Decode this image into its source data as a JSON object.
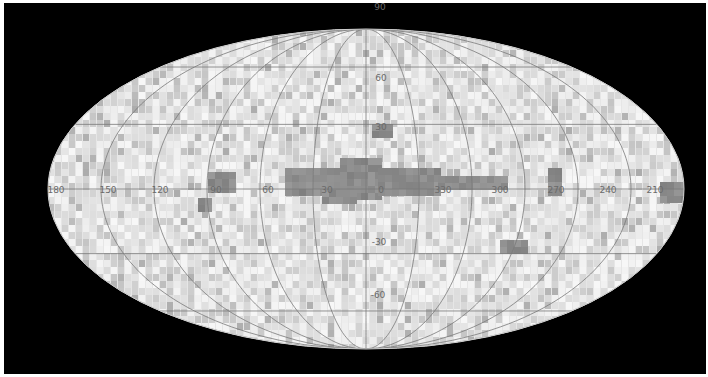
{
  "figure": {
    "type": "all-sky map",
    "projection": "elliptical (Mollweide-like)",
    "background_color": "#000000",
    "map_fill_color": "#e6e6e6",
    "grid_color": "#7a7a7a",
    "dark_cell_color": "#8a8a8a",
    "center": {
      "x": 366,
      "y": 189
    },
    "semi_axes": {
      "rx": 318,
      "ry": 160
    }
  },
  "longitude_labels": [
    {
      "text": "180",
      "x": 56
    },
    {
      "text": "150",
      "x": 108
    },
    {
      "text": "120",
      "x": 160
    },
    {
      "text": "90",
      "x": 216
    },
    {
      "text": "60",
      "x": 268
    },
    {
      "text": "30",
      "x": 327
    },
    {
      "text": "0",
      "x": 381
    },
    {
      "text": "330",
      "x": 443
    },
    {
      "text": "300",
      "x": 500
    },
    {
      "text": "270",
      "x": 556
    },
    {
      "text": "240",
      "x": 608
    },
    {
      "text": "210",
      "x": 655
    }
  ],
  "latitude_labels": [
    {
      "text": "90",
      "x": 380,
      "y": 10
    },
    {
      "text": "60",
      "x": 381,
      "y": 81
    },
    {
      "text": "30",
      "x": 381,
      "y": 130
    },
    {
      "text": "-30",
      "x": 379,
      "y": 245
    },
    {
      "text": "-60",
      "x": 378,
      "y": 298
    }
  ],
  "dark_regions": [
    {
      "x": 372,
      "y": 124,
      "w": 16,
      "h": 14
    },
    {
      "x": 208,
      "y": 172,
      "w": 28,
      "h": 18
    },
    {
      "x": 198,
      "y": 198,
      "w": 14,
      "h": 14
    },
    {
      "x": 285,
      "y": 168,
      "w": 60,
      "h": 22
    },
    {
      "x": 340,
      "y": 158,
      "w": 40,
      "h": 42
    },
    {
      "x": 378,
      "y": 168,
      "w": 60,
      "h": 24
    },
    {
      "x": 438,
      "y": 176,
      "w": 70,
      "h": 14
    },
    {
      "x": 322,
      "y": 190,
      "w": 30,
      "h": 12
    },
    {
      "x": 548,
      "y": 168,
      "w": 14,
      "h": 24
    },
    {
      "x": 500,
      "y": 240,
      "w": 22,
      "h": 8
    },
    {
      "x": 660,
      "y": 182,
      "w": 24,
      "h": 18
    }
  ]
}
